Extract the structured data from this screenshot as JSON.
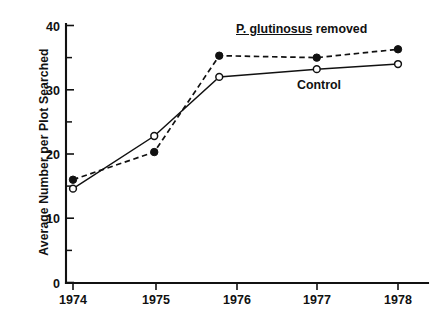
{
  "chart_data": {
    "type": "line",
    "title": "",
    "xlabel": "",
    "ylabel": "Average Number per Plot Searched",
    "xlim": [
      1973.6,
      1978.45
    ],
    "ylim": [
      0,
      41
    ],
    "grid": false,
    "legend_position": "inline-annotation",
    "x_ticks": [
      "1974",
      "1975",
      "1976",
      "1977",
      "1978"
    ],
    "x_tick_values": [
      1974,
      1975,
      1976,
      1977,
      1978
    ],
    "y_ticks": [
      "0",
      "10",
      "20",
      "30",
      "40"
    ],
    "y_tick_values": [
      0,
      10,
      20,
      30,
      40
    ],
    "y_minor_tick_values": [
      5,
      15,
      25,
      35
    ],
    "x": [
      1974,
      1975,
      1975.8,
      1977,
      1978
    ],
    "series": [
      {
        "name": "P. glutinosus removed",
        "marker": "filled-circle",
        "linestyle": "dashed",
        "values": [
          16.0,
          20.3,
          35.3,
          35.0,
          36.3
        ]
      },
      {
        "name": "Control",
        "marker": "open-circle",
        "linestyle": "solid",
        "values": [
          14.6,
          22.8,
          32.0,
          33.2,
          34.0
        ]
      }
    ],
    "annotations": [
      {
        "id": "removed-label",
        "text_italic_part": "P. glutinosus",
        "text_plain_part": " removed",
        "full_text": "P. glutinosus removed"
      },
      {
        "id": "control-label",
        "full_text": "Control"
      }
    ],
    "colors": {
      "ink": "#111111",
      "background": "#ffffff"
    }
  }
}
